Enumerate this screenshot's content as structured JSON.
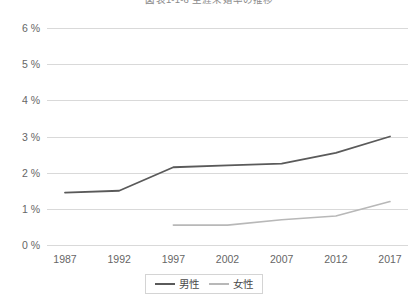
{
  "chart_data": {
    "type": "line",
    "title": "図表1-1-6 生涯未婚率の推移",
    "xlabel": "",
    "ylabel": "",
    "x": [
      "1987",
      "1992",
      "1997",
      "2002",
      "2007",
      "2012",
      "2017"
    ],
    "categories": [
      "1987",
      "1992",
      "1997",
      "2002",
      "2007",
      "2012",
      "2017"
    ],
    "series": [
      {
        "name": "男性",
        "color": "#5a5a5a",
        "values": [
          1.45,
          1.5,
          2.15,
          2.2,
          2.25,
          2.55,
          3.0
        ]
      },
      {
        "name": "女性",
        "color": "#b8b8b8",
        "values": [
          null,
          null,
          0.55,
          0.55,
          0.7,
          0.8,
          1.2
        ]
      }
    ],
    "ylim": [
      0,
      6
    ],
    "y_ticks": [
      0,
      1,
      2,
      3,
      4,
      5,
      6
    ],
    "y_tick_labels": [
      "0 %",
      "1 %",
      "2 %",
      "3 %",
      "4 %",
      "5 %",
      "6 %"
    ],
    "grid": true,
    "legend_position": "bottom"
  },
  "legend": {
    "entries": [
      {
        "label": "男性",
        "color": "#5a5a5a"
      },
      {
        "label": "女性",
        "color": "#b8b8b8"
      }
    ]
  },
  "colors": {
    "male_line": "#5a5a5a",
    "female_line": "#b8b8b8",
    "gridline": "#d9d9d9",
    "tick_text": "#666666",
    "background": "#ffffff"
  }
}
